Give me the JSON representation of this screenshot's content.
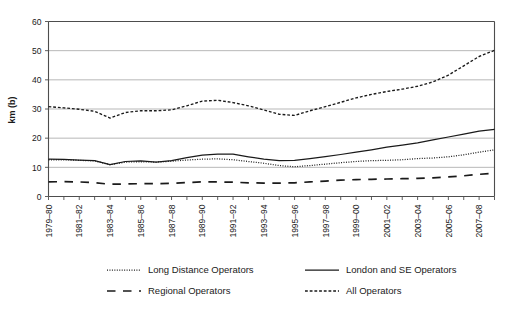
{
  "chart_data": {
    "type": "line",
    "title": "",
    "xlabel": "",
    "ylabel": "km (b)",
    "ylim": [
      0,
      60
    ],
    "ytick_values": [
      0,
      10,
      20,
      30,
      40,
      50,
      60
    ],
    "grid": true,
    "legend_position": "bottom",
    "x": [
      "1979-80",
      "1980-81",
      "1981-82",
      "1982-83",
      "1983-84",
      "1984-85",
      "1985-86",
      "1986-87",
      "1987-88",
      "1988-89",
      "1989-90",
      "1990-91",
      "1991-92",
      "1992-93",
      "1993-94",
      "1994-95",
      "1995-96",
      "1996-97",
      "1997-98",
      "1998-99",
      "1999-00",
      "2000-01",
      "2001-02",
      "2002-03",
      "2003-04",
      "2004-05",
      "2005-06",
      "2006-07",
      "2007-08",
      "2008-09"
    ],
    "xtick_labels": [
      "1979–80",
      "1981–82",
      "1983–84",
      "1985–86",
      "1987–88",
      "1989–90",
      "1991–92",
      "1993–94",
      "1995–96",
      "1997–98",
      "1999–00",
      "2001–02",
      "2003–04",
      "2005–06",
      "2007–08"
    ],
    "series": [
      {
        "name": "Long Distance Operators",
        "style": "dotted",
        "values": [
          12.6,
          12.6,
          12.4,
          12.2,
          10.9,
          11.8,
          11.9,
          11.8,
          12.1,
          12.5,
          12.8,
          12.9,
          12.6,
          12.0,
          11.4,
          10.6,
          10.2,
          10.6,
          11.1,
          11.6,
          12.0,
          12.3,
          12.4,
          12.6,
          13.0,
          13.2,
          13.6,
          14.3,
          15.2,
          16.0
        ]
      },
      {
        "name": "London and SE Operators",
        "style": "solid",
        "values": [
          12.8,
          12.7,
          12.5,
          12.3,
          10.9,
          12.0,
          12.2,
          11.8,
          12.3,
          13.3,
          14.2,
          14.5,
          14.5,
          13.6,
          12.8,
          12.3,
          12.4,
          13.0,
          13.7,
          14.4,
          15.2,
          16.0,
          16.9,
          17.6,
          18.4,
          19.4,
          20.4,
          21.4,
          22.4,
          23.0
        ]
      },
      {
        "name": "Regional Operators",
        "style": "dashed-long",
        "values": [
          5.0,
          5.1,
          5.0,
          4.7,
          4.2,
          4.3,
          4.4,
          4.4,
          4.5,
          4.8,
          5.0,
          5.0,
          4.9,
          4.7,
          4.6,
          4.6,
          4.7,
          5.0,
          5.3,
          5.6,
          5.8,
          5.9,
          6.0,
          6.1,
          6.2,
          6.4,
          6.7,
          7.1,
          7.6,
          8.0
        ]
      },
      {
        "name": "All Operators",
        "style": "dashed-short",
        "values": [
          30.8,
          30.4,
          29.9,
          29.2,
          26.9,
          28.8,
          29.4,
          29.4,
          29.7,
          31.1,
          32.7,
          33.0,
          32.2,
          31.1,
          29.7,
          28.2,
          27.8,
          29.4,
          30.8,
          32.3,
          33.8,
          35.0,
          36.0,
          36.8,
          37.8,
          39.3,
          41.6,
          44.8,
          48.0,
          50.1
        ]
      }
    ]
  },
  "legend": {
    "items": [
      {
        "label": "Long Distance Operators",
        "style": "dotted"
      },
      {
        "label": "London and SE Operators",
        "style": "solid"
      },
      {
        "label": "Regional Operators",
        "style": "dashed-long"
      },
      {
        "label": "All Operators",
        "style": "dashed-short"
      }
    ]
  },
  "colors": {
    "line": "#1a1a1a",
    "grid": "#9a9a9a",
    "axis": "#4d4d4d",
    "background": "#ffffff"
  }
}
